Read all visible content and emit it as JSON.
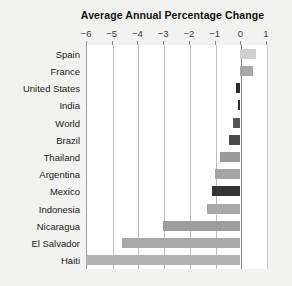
{
  "chart_data": {
    "type": "bar",
    "orientation": "horizontal",
    "title": "Average Annual Percentage Change",
    "xlabel": "",
    "ylabel": "",
    "xlim": [
      -6,
      1
    ],
    "xticks": [
      -6,
      -5,
      -4,
      -3,
      -2,
      -1,
      0,
      1
    ],
    "xtick_labels": [
      "−6",
      "−5",
      "−4",
      "−3",
      "−2",
      "−1",
      "0",
      "1"
    ],
    "grid": true,
    "legend": "none",
    "categories": [
      "Spain",
      "France",
      "United States",
      "India",
      "World",
      "Brazil",
      "Thailand",
      "Argentina",
      "Mexico",
      "Indonesia",
      "Nicaragua",
      "El Salvador",
      "Haiti"
    ],
    "values": [
      0.6,
      0.5,
      -0.15,
      -0.1,
      -0.3,
      -0.45,
      -0.8,
      -1.0,
      -1.1,
      -1.3,
      -3.0,
      -4.6,
      -6.0
    ],
    "bar_colors": [
      "#d0d0d0",
      "#a8a8a8",
      "#2b2b2b",
      "#2b2b2b",
      "#555555",
      "#4a4a4a",
      "#9a9a9a",
      "#a5a5a5",
      "#333333",
      "#a8a8a8",
      "#9e9e9e",
      "#a8a8a8",
      "#b3b3b3"
    ]
  },
  "colors": {
    "page_background": "#f2f2f0",
    "plot_background": "#ffffff",
    "gridline": "#bdbdbd",
    "zero_line": "#7d7d7d",
    "title_text": "#111111",
    "label_text": "#1a1a1a",
    "tick_text": "#3a3a3a"
  }
}
